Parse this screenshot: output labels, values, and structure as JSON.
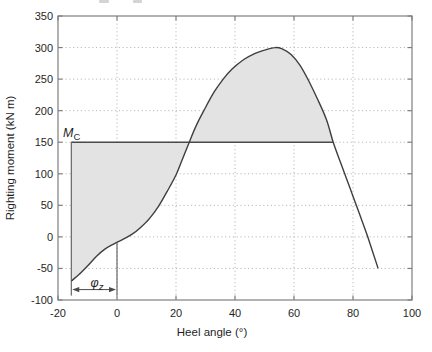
{
  "figure": {
    "background": "#ffffff",
    "frame_color": "#7f7f7f",
    "grid_color": "#b9b9b9",
    "curve_color": "#3f3f3f",
    "mc_line_color": "#4a4a4a",
    "shade_color": "#e3e3e3",
    "text_color": "#1f1f1f"
  },
  "chart_data": {
    "type": "line",
    "title": "",
    "xlabel": "Heel angle (°)",
    "ylabel": "Righting moment (kN m)",
    "xlim": [
      -20,
      100
    ],
    "ylim": [
      -100,
      350
    ],
    "xticks": [
      -20,
      0,
      20,
      40,
      60,
      80,
      100
    ],
    "yticks": [
      -100,
      -50,
      0,
      50,
      100,
      150,
      200,
      250,
      300,
      350
    ],
    "grid": "dotted",
    "series": [
      {
        "name": "righting-moment-curve",
        "points": [
          [
            -15.5,
            -70
          ],
          [
            -13,
            -60
          ],
          [
            -10,
            -46
          ],
          [
            -7,
            -31
          ],
          [
            -4,
            -19
          ],
          [
            -1,
            -11
          ],
          [
            2,
            -4
          ],
          [
            5,
            4
          ],
          [
            8,
            15
          ],
          [
            11,
            29
          ],
          [
            14,
            48
          ],
          [
            17,
            72
          ],
          [
            20,
            98
          ],
          [
            22,
            121
          ],
          [
            24.5,
            150
          ],
          [
            27,
            178
          ],
          [
            30,
            205
          ],
          [
            33,
            230
          ],
          [
            36,
            250
          ],
          [
            39,
            266
          ],
          [
            43,
            281
          ],
          [
            47,
            291
          ],
          [
            50,
            296
          ],
          [
            53.5,
            300
          ],
          [
            56,
            298
          ],
          [
            59,
            289
          ],
          [
            62,
            272
          ],
          [
            65,
            247
          ],
          [
            68,
            218
          ],
          [
            71,
            186
          ],
          [
            73.3,
            150
          ],
          [
            76,
            115
          ],
          [
            79,
            77
          ],
          [
            82,
            39
          ],
          [
            85,
            0
          ],
          [
            88.5,
            -50
          ]
        ]
      },
      {
        "name": "capsizing-moment-line",
        "y": 150,
        "x_start": -15.5,
        "x_end": 73.3
      }
    ],
    "shaded_region": {
      "description": "area enclosed between righting-moment curve, the horizontal M_C = 150 line, and the vertical at the initial heel angle",
      "x_start": -15.5,
      "x_end": 73.3
    },
    "annotations": {
      "mc_label": {
        "main": "M",
        "sub": "C",
        "x": -18.3,
        "y": 158
      },
      "phi_label": {
        "main": "φ",
        "sub": "z",
        "x": -6.8,
        "y": -80
      },
      "phi_arrow": {
        "x_from": -15.5,
        "x_to": 0,
        "y": -83.5
      },
      "vertical_line_left": {
        "x": -15.5,
        "y_from": 150,
        "y_to": -93
      },
      "vertical_line_zero": {
        "x": 0,
        "y_from": -9,
        "y_to": -93
      }
    }
  }
}
